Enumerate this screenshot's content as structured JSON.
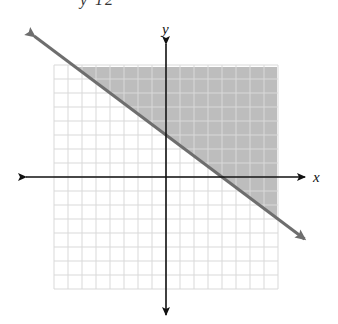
{
  "header": {
    "clipped_text": "y  12"
  },
  "axes": {
    "x_label": "x",
    "y_label": "y"
  },
  "colors": {
    "grid": "#d9d9d9",
    "shade": "#bdbdbd",
    "boundary_line": "#6e6e6e",
    "axis": "#111111"
  },
  "chart_data": {
    "type": "area",
    "title": "",
    "xlabel": "x",
    "ylabel": "y",
    "xlim": [
      -8,
      8
    ],
    "ylim": [
      -8,
      8
    ],
    "grid": true,
    "boundary": {
      "equation": "3x + 4y = 12",
      "x_intercept": 4,
      "y_intercept": 3,
      "slope": -0.75,
      "style": "solid"
    },
    "shaded_region": "above boundary line (3x + 4y >= 12)",
    "points": [
      {
        "x": 0,
        "y": 3
      },
      {
        "x": 4,
        "y": 0
      }
    ]
  }
}
